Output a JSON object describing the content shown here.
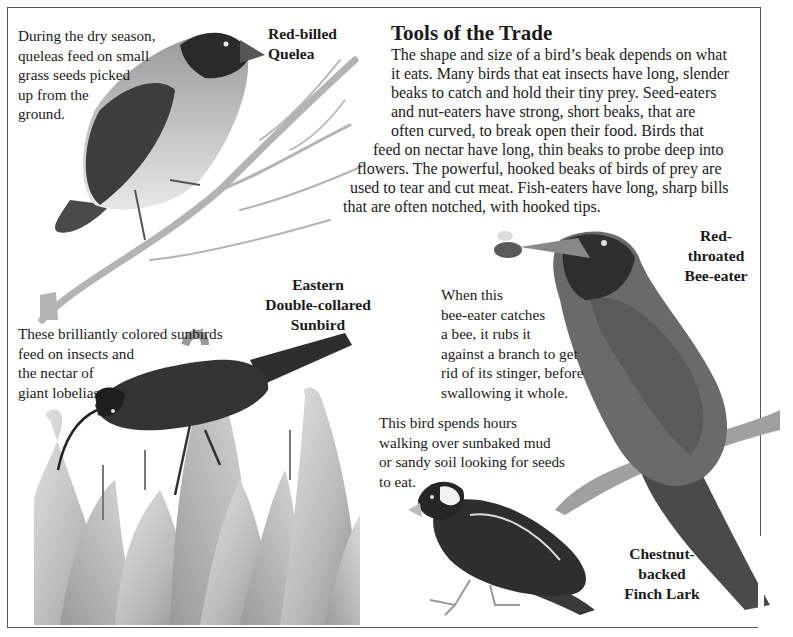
{
  "page": {
    "title": "Tools of the Trade",
    "body_lines": [
      "The shape and size of a bird’s beak depends on what",
      "it eats. Many birds that eat insects have long, slender",
      "beaks to catch and hold their tiny prey. Seed-eaters",
      "and nut-eaters have strong, short beaks, that are",
      "often curved, to break open their food. Birds that",
      "feed on nectar have long, thin beaks to probe deep into",
      "flowers. The powerful, hooked beaks of birds of prey are",
      "used to tear and cut meat. Fish-eaters have long, sharp bills",
      "that are often notched, with hooked tips."
    ]
  },
  "birds": {
    "quelea": {
      "name_lines": [
        "Red-billed",
        "Quelea"
      ],
      "caption_lines": [
        "During the dry season,",
        "queleas feed on small",
        "grass  seeds picked",
        "up from the",
        "ground."
      ]
    },
    "sunbird": {
      "name_lines": [
        "Eastern",
        "Double-collared",
        "Sunbird"
      ],
      "caption_lines": [
        "These brilliantly colored sunbirds",
        "feed on insects and",
        "the nectar of",
        "giant lobelias."
      ]
    },
    "bee_eater": {
      "name_lines": [
        "Red-",
        "throated",
        "Bee-eater"
      ],
      "caption_lines": [
        "When this",
        "bee-eater catches",
        "a bee, it rubs it",
        "against a branch to get",
        " rid of its stinger, before",
        "swallowing it whole."
      ]
    },
    "finch_lark": {
      "name_lines": [
        "Chestnut-",
        "backed",
        "Finch Lark"
      ],
      "caption_lines": [
        "This bird spends hours",
        "walking over sunbaked mud",
        "or sandy soil looking for seeds",
        "to eat."
      ]
    }
  },
  "illustrations": [
    {
      "id": "quelea",
      "icon": "bird-on-branch-illustration"
    },
    {
      "id": "sunbird",
      "icon": "sunbird-on-lobelia-illustration"
    },
    {
      "id": "bee_eater",
      "icon": "bee-eater-with-bee-illustration"
    },
    {
      "id": "finch_lark",
      "icon": "finch-lark-illustration"
    }
  ]
}
